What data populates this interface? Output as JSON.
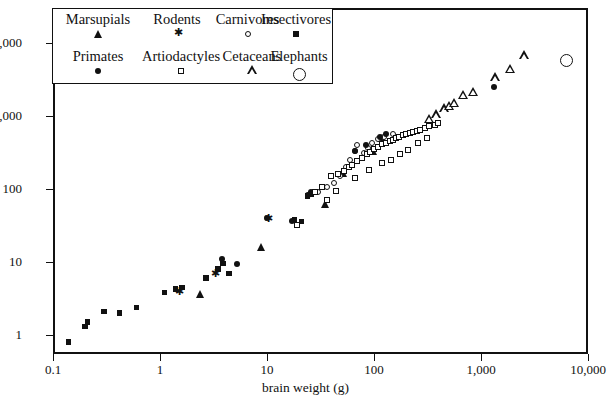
{
  "chart_data": {
    "type": "scatter",
    "title": "",
    "xlabel": "brain weight (g)",
    "ylabel": "",
    "xscale": "log",
    "yscale": "log",
    "xlim": [
      0.1,
      10000
    ],
    "ylim": [
      0.55,
      30000
    ],
    "xticks": [
      "0.1",
      "1",
      "10",
      "100",
      "1,000",
      "10,000"
    ],
    "xtick_values": [
      0.1,
      1,
      10,
      100,
      1000,
      10000
    ],
    "yticks": [
      "1",
      "10",
      "100",
      "1,000",
      "10,000"
    ],
    "ytick_values": [
      1,
      10,
      100,
      1000,
      10000
    ],
    "grid": false,
    "legend_position": "upper-left-inset",
    "series": [
      {
        "name": "Marsupials",
        "marker": "filled-triangle",
        "color": "#111111",
        "points": [
          [
            2.4,
            3.6
          ],
          [
            8.8,
            16.0
          ],
          [
            35.0,
            63.0
          ],
          [
            52.0,
            165.0
          ],
          [
            98.0,
            330.0
          ],
          [
            120.0,
            500.0
          ]
        ]
      },
      {
        "name": "Rodents",
        "marker": "star",
        "color": "#111111",
        "points": [
          [
            1.5,
            3.9
          ],
          [
            3.2,
            7.0
          ],
          [
            10.0,
            40.0
          ]
        ]
      },
      {
        "name": "Carnivores",
        "marker": "open-circle",
        "color": "#111111",
        "points": [
          [
            25.0,
            85.0
          ],
          [
            30.0,
            90.0
          ],
          [
            48.0,
            150.0
          ],
          [
            55.0,
            200.0
          ],
          [
            60.0,
            250.0
          ],
          [
            66.0,
            330.0
          ],
          [
            70.0,
            400.0
          ],
          [
            80.0,
            310.0
          ],
          [
            88.0,
            360.0
          ],
          [
            95.0,
            430.0
          ],
          [
            110.0,
            480.0
          ],
          [
            125.0,
            520.0
          ],
          [
            42.0,
            120.0
          ],
          [
            36.0,
            105.0
          ],
          [
            52.0,
            175.0
          ],
          [
            150.0,
            560.0
          ]
        ]
      },
      {
        "name": "Insectivores",
        "marker": "filled-square",
        "color": "#111111",
        "points": [
          [
            0.14,
            0.8
          ],
          [
            0.2,
            1.3
          ],
          [
            0.21,
            1.5
          ],
          [
            0.3,
            2.1
          ],
          [
            0.42,
            2.0
          ],
          [
            1.1,
            3.8
          ],
          [
            1.4,
            4.3
          ],
          [
            1.6,
            4.5
          ],
          [
            3.5,
            8.0
          ],
          [
            4.4,
            7.0
          ],
          [
            3.9,
            9.5
          ],
          [
            2.7,
            6.0
          ],
          [
            18.0,
            38.0
          ],
          [
            21.0,
            36.0
          ],
          [
            24.0,
            80.0
          ],
          [
            26.0,
            85.0
          ],
          [
            0.6,
            2.4
          ]
        ]
      },
      {
        "name": "Primates",
        "marker": "filled-circle",
        "color": "#111111",
        "points": [
          [
            3.8,
            11.0
          ],
          [
            5.2,
            9.5
          ],
          [
            10.0,
            40.0
          ],
          [
            17.0,
            36.0
          ],
          [
            24.0,
            83.0
          ],
          [
            26.0,
            90.0
          ],
          [
            66.0,
            330.0
          ],
          [
            84.0,
            400.0
          ],
          [
            115.0,
            520.0
          ],
          [
            1330.0,
            2500.0
          ],
          [
            130.0,
            560.0
          ]
        ]
      },
      {
        "name": "Artiodactyles",
        "marker": "open-square",
        "color": "#111111",
        "points": [
          [
            19.0,
            32.0
          ],
          [
            28.0,
            90.0
          ],
          [
            33.0,
            105.0
          ],
          [
            40.0,
            150.0
          ],
          [
            46.0,
            160.0
          ],
          [
            52.0,
            175.0
          ],
          [
            58.0,
            200.0
          ],
          [
            62.0,
            215.0
          ],
          [
            70.0,
            240.0
          ],
          [
            78.0,
            265.0
          ],
          [
            86.0,
            300.0
          ],
          [
            92.0,
            320.0
          ],
          [
            100.0,
            350.0
          ],
          [
            110.0,
            380.0
          ],
          [
            120.0,
            410.0
          ],
          [
            130.0,
            430.0
          ],
          [
            140.0,
            450.0
          ],
          [
            150.0,
            470.0
          ],
          [
            160.0,
            500.0
          ],
          [
            172.0,
            520.0
          ],
          [
            185.0,
            545.0
          ],
          [
            200.0,
            560.0
          ],
          [
            215.0,
            580.0
          ],
          [
            230.0,
            600.0
          ],
          [
            250.0,
            625.0
          ],
          [
            270.0,
            650.0
          ],
          [
            300.0,
            690.0
          ],
          [
            330.0,
            720.0
          ],
          [
            370.0,
            760.0
          ],
          [
            400.0,
            800.0
          ],
          [
            66.0,
            140.0
          ],
          [
            90.0,
            180.0
          ],
          [
            120.0,
            230.0
          ],
          [
            145.0,
            250.0
          ],
          [
            175.0,
            300.0
          ],
          [
            210.0,
            340.0
          ],
          [
            260.0,
            420.0
          ],
          [
            310.0,
            500.0
          ],
          [
            36.0,
            70.0
          ],
          [
            44.0,
            95.0
          ]
        ]
      },
      {
        "name": "Cetaceans",
        "marker": "open-triangle",
        "color": "#111111",
        "points": [
          [
            420.0,
            800.0
          ],
          [
            500.0,
            980.0
          ],
          [
            560.0,
            1050.0
          ],
          [
            620.0,
            1150.0
          ],
          [
            760.0,
            1500.0
          ],
          [
            930.0,
            1650.0
          ],
          [
            1500.0,
            2600.0
          ],
          [
            2100.0,
            3400.0
          ],
          [
            2800.0,
            5200.0
          ],
          [
            360.0,
            700.0
          ]
        ]
      },
      {
        "name": "Elephants",
        "marker": "large-open-circle",
        "color": "#111111",
        "points": [
          [
            6300.0,
            5800.0
          ]
        ]
      }
    ]
  },
  "legend": {
    "row1": [
      {
        "label": "Marsupials",
        "marker": "filled-triangle"
      },
      {
        "label": "Rodents",
        "marker": "star"
      },
      {
        "label": "Carnivores",
        "marker": "open-circle"
      },
      {
        "label": "Insectivores",
        "marker": "filled-square"
      }
    ],
    "row2": [
      {
        "label": "Primates",
        "marker": "filled-circle"
      },
      {
        "label": "Artiodactyles",
        "marker": "open-square"
      },
      {
        "label": "Cetaceans",
        "marker": "open-triangle"
      },
      {
        "label": "Elephants",
        "marker": "large-open-circle"
      }
    ]
  }
}
